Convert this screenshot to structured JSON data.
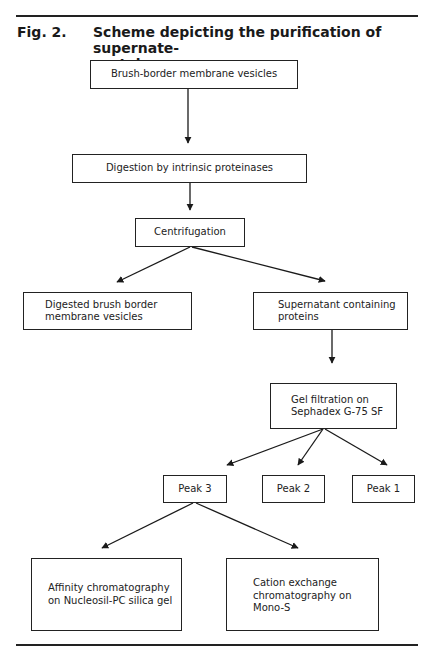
{
  "figure": {
    "label": "Fig. 2.",
    "title": "Scheme depicting the purification of supernate-\nproteins"
  },
  "nodes": {
    "bbmv": "Brush-border membrane vesicles",
    "digestion": "Digestion by intrinsic proteinases",
    "centrifugation": "Centrifugation",
    "digested": "Digested brush border\nmembrane vesicles",
    "supernatant": "Supernatant containing\nproteins",
    "gel_filtration": "Gel filtration on\nSephadex G-75 SF",
    "peak3": "Peak 3",
    "peak2": "Peak 2",
    "peak1": "Peak 1",
    "affinity": "Affinity chromatography\non Nucleosil-PC silica gel",
    "cation": "Cation exchange\nchromatography on\nMono-S"
  },
  "edges": [
    [
      "bbmv",
      "digestion"
    ],
    [
      "digestion",
      "centrifugation"
    ],
    [
      "centrifugation",
      "digested"
    ],
    [
      "centrifugation",
      "supernatant"
    ],
    [
      "supernatant",
      "gel_filtration"
    ],
    [
      "gel_filtration",
      "peak3"
    ],
    [
      "gel_filtration",
      "peak2"
    ],
    [
      "gel_filtration",
      "peak1"
    ],
    [
      "peak3",
      "affinity"
    ],
    [
      "peak3",
      "cation"
    ]
  ]
}
